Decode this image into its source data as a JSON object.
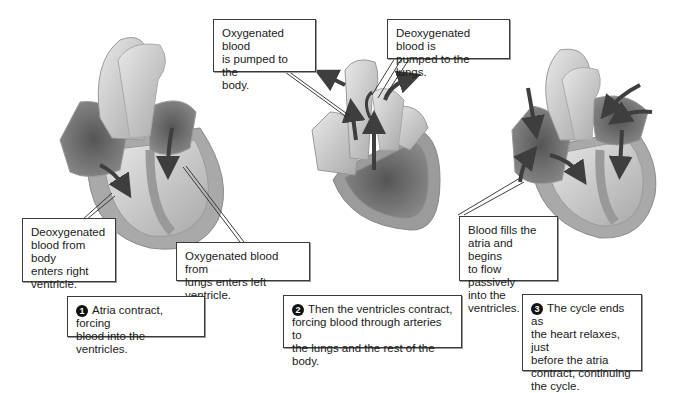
{
  "colors": {
    "background": "#ffffff",
    "box_border": "#3a3a3a",
    "text": "#1a1a1a",
    "heart_light": "#d9d9d9",
    "heart_mid": "#a8a8a8",
    "heart_dark": "#6e6e6e",
    "arrow": "#4a4a4a"
  },
  "panels": [
    {
      "id": "atrial-systole",
      "callouts": [
        {
          "text": "Deoxygenated blood from body enters right ventricle.",
          "lines": [
            "Deoxygenated",
            "blood from body",
            "enters right",
            "ventricle."
          ]
        },
        {
          "text": "Oxygenated blood from lungs enters left ventricle.",
          "lines": [
            "Oxygenated blood from",
            "lungs enters left ventricle."
          ]
        }
      ],
      "step": {
        "number": "1",
        "lines": [
          "Atria contract, forcing",
          "blood into the ventricles."
        ]
      }
    },
    {
      "id": "ventricular-systole",
      "callouts": [
        {
          "text": "Oxygenated blood is pumped to the body.",
          "lines": [
            "Oxygenated blood",
            "is pumped to the",
            "body."
          ]
        },
        {
          "text": "Deoxygenated blood is pumped to the lungs.",
          "lines": [
            "Deoxygenated blood is",
            "pumped to the lungs."
          ]
        }
      ],
      "step": {
        "number": "2",
        "lines": [
          "Then the ventricles contract,",
          "forcing blood through arteries to",
          "the lungs and the rest of the body."
        ]
      }
    },
    {
      "id": "diastole",
      "callouts": [
        {
          "text": "Blood fills the atria and begins to flow passively into the ventricles.",
          "lines": [
            "Blood fills the",
            "atria and begins",
            "to flow passively",
            "into the ventricles."
          ]
        }
      ],
      "step": {
        "number": "3",
        "lines": [
          "The cycle ends as",
          "the heart relaxes, just",
          "before the atria",
          "contract, continuing",
          "the cycle."
        ]
      }
    }
  ]
}
